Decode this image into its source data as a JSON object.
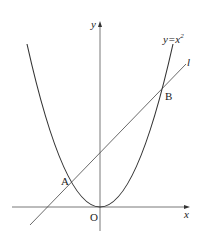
{
  "diagram": {
    "curve_label": "y=x",
    "curve_exponent": "2",
    "line_label": "l",
    "x_axis_label": "x",
    "y_axis_label": "y",
    "origin_label": "O",
    "point_a_label": "A",
    "point_b_label": "B",
    "colors": {
      "stroke": "#333333",
      "axis": "#555555",
      "text": "#222222"
    }
  }
}
